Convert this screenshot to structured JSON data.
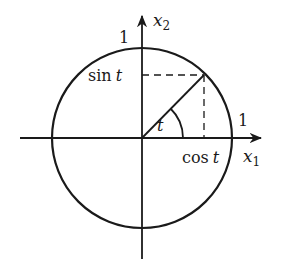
{
  "figure": {
    "type": "unit-circle",
    "colors": {
      "stroke": "#1a1a1a",
      "background": "#ffffff"
    },
    "labels": {
      "x_axis": {
        "var": "x",
        "sub": "1"
      },
      "y_axis": {
        "var": "x",
        "sub": "2"
      },
      "top_one": "1",
      "right_one": "1",
      "sin": {
        "fn": "sin",
        "arg": "t"
      },
      "cos": {
        "fn": "cos",
        "arg": "t"
      },
      "angle": "t"
    },
    "geometry": {
      "center": [
        142,
        138
      ],
      "radius": 90,
      "angle_deg": 46,
      "point": [
        203,
        75
      ],
      "arc_radius": 41
    }
  }
}
